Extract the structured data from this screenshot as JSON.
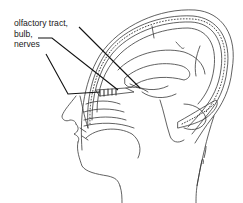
{
  "figure": {
    "label_lines": [
      "olfactory tract,",
      "bulb,",
      "nerves"
    ],
    "signature": "M. Lehman",
    "colors": {
      "line": "#2a2a2a",
      "leader": "#111111",
      "background": "#ffffff"
    }
  }
}
